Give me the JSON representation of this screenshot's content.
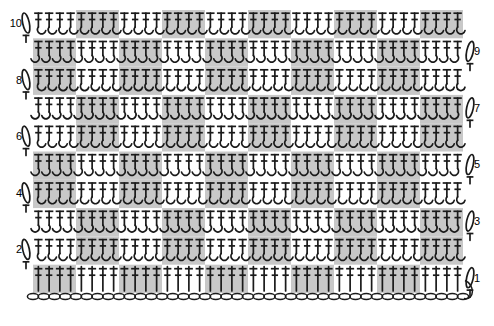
{
  "chart": {
    "kind": "crochet-stitch-diagram",
    "stitch_columns": 40,
    "pattern_rows": 10,
    "foundation_chain_label": "foundation-chain",
    "block_width_stitches": 4,
    "shade_color": "#c8c8c8",
    "ink_color": "#1a1a1a",
    "background_color": "#ffffff",
    "symbol_legend": [
      {
        "name": "front-post-double-crochet",
        "note": "vertical post with hook curving left"
      },
      {
        "name": "back-post-double-crochet",
        "note": "vertical post with hook curving right"
      },
      {
        "name": "double-crochet",
        "note": "straight vertical post with single cross bar"
      },
      {
        "name": "chain-stitch",
        "note": "elongated oval"
      },
      {
        "name": "turning-chain",
        "note": "tall elongated oval at row edge"
      }
    ],
    "row_labels_left": [
      "10",
      "8",
      "6",
      "4",
      "2"
    ],
    "row_labels_right": [
      "9",
      "7",
      "5",
      "3",
      "1"
    ],
    "rows": [
      {
        "number": "10",
        "side": "left",
        "symbol": "back-post-double-crochet",
        "shade_phase": 1,
        "has_turning_chain": true
      },
      {
        "number": "9",
        "side": "right",
        "symbol": "front-post-double-crochet",
        "shade_phase": 0,
        "has_turning_chain": true
      },
      {
        "number": "8",
        "side": "left",
        "symbol": "back-post-double-crochet",
        "shade_phase": 0,
        "has_turning_chain": true
      },
      {
        "number": "7",
        "side": "right",
        "symbol": "front-post-double-crochet",
        "shade_phase": 1,
        "has_turning_chain": true
      },
      {
        "number": "6",
        "side": "left",
        "symbol": "back-post-double-crochet",
        "shade_phase": 1,
        "has_turning_chain": true
      },
      {
        "number": "5",
        "side": "right",
        "symbol": "front-post-double-crochet",
        "shade_phase": 0,
        "has_turning_chain": true
      },
      {
        "number": "4",
        "side": "left",
        "symbol": "back-post-double-crochet",
        "shade_phase": 0,
        "has_turning_chain": true
      },
      {
        "number": "3",
        "side": "right",
        "symbol": "front-post-double-crochet",
        "shade_phase": 1,
        "has_turning_chain": true
      },
      {
        "number": "2",
        "side": "left",
        "symbol": "back-post-double-crochet",
        "shade_phase": 1,
        "has_turning_chain": true
      },
      {
        "number": "1",
        "side": "right",
        "symbol": "double-crochet",
        "shade_phase": 0,
        "has_turning_chain": true
      }
    ]
  },
  "chart_data": {
    "type": "table",
    "xlabel": "",
    "ylabel": "",
    "grid": false,
    "legend": "none",
    "categories": [
      "1",
      "2",
      "3",
      "4",
      "5",
      "6",
      "7",
      "8",
      "9",
      "10"
    ],
    "series": [
      {
        "name": "stitches-per-row",
        "values": [
          40,
          40,
          40,
          40,
          40,
          40,
          40,
          40,
          40,
          40
        ]
      },
      {
        "name": "shade-phase",
        "values": [
          0,
          1,
          1,
          0,
          0,
          1,
          1,
          0,
          0,
          1
        ]
      }
    ],
    "annotations": [
      {
        "text": "10",
        "position": "left"
      },
      {
        "text": "9",
        "position": "right"
      },
      {
        "text": "8",
        "position": "left"
      },
      {
        "text": "7",
        "position": "right"
      },
      {
        "text": "6",
        "position": "left"
      },
      {
        "text": "5",
        "position": "right"
      },
      {
        "text": "4",
        "position": "left"
      },
      {
        "text": "3",
        "position": "right"
      },
      {
        "text": "2",
        "position": "left"
      },
      {
        "text": "1",
        "position": "right"
      }
    ]
  }
}
